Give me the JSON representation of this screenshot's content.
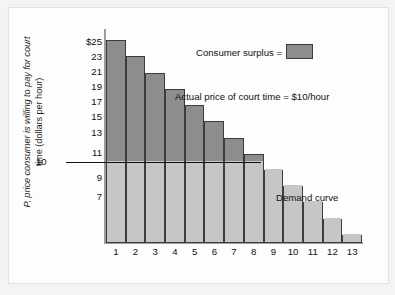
{
  "figure": {
    "background_color": "#fdfdfd",
    "frame_color": "#e2e2e2"
  },
  "axes": {
    "ylabel_line1": "P, price consumer is willing to pay for court",
    "ylabel_line2": "time (dollars per hour)",
    "xlabel": "Q, hours of court time",
    "ytick_labels": [
      "$25",
      "23",
      "21",
      "19",
      "17",
      "15",
      "13",
      "11",
      "9",
      "7"
    ],
    "xtick_labels": [
      "1",
      "2",
      "3",
      "4",
      "5",
      "6",
      "7",
      "8",
      "9",
      "10",
      "11",
      "12",
      "13"
    ]
  },
  "price_line": {
    "label": "10",
    "value": 10
  },
  "annotations": {
    "legend_text": "Consumer surplus =",
    "actual_price_text": "Actual price of court time = $10/hour",
    "demand_curve_text": "Demand curve"
  },
  "colors": {
    "consumer_surplus_fill": "#8d8d8d",
    "below_price_fill": "#c6c6c6",
    "bar_outline": "#3c3c3c",
    "axis": "#9d9d9d",
    "text": "#111111"
  },
  "chart_data": {
    "type": "bar",
    "title": "",
    "xlabel": "Q, hours of court time",
    "ylabel": "P, price consumer is willing to pay for court time (dollars per hour)",
    "categories": [
      1,
      2,
      3,
      4,
      5,
      6,
      7,
      8,
      9,
      10,
      11,
      12,
      13
    ],
    "values": [
      25,
      23,
      21,
      19,
      17,
      15,
      13,
      11,
      9,
      7,
      5,
      3,
      1
    ],
    "ylim": [
      0,
      26
    ],
    "xlim": [
      0,
      13
    ],
    "grid": false,
    "legend_position": "upper-right",
    "legend_entries": [
      {
        "label": "Consumer surplus =",
        "color": "#8d8d8d"
      }
    ],
    "reference_lines": [
      {
        "label": "Actual price of court time = $10/hour",
        "y": 10,
        "orientation": "horizontal"
      }
    ],
    "series_annotations": [
      {
        "label": "Demand curve",
        "describes": "step outline of bar tops"
      }
    ]
  }
}
